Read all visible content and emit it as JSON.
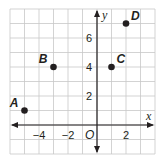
{
  "chart_data": {
    "type": "scatter",
    "title": "",
    "xlabel": "x",
    "ylabel": "y",
    "origin_label": "O",
    "xlim": [
      -6,
      4
    ],
    "ylim": [
      -2,
      8
    ],
    "grid": true,
    "x_ticks": [
      {
        "value": -4,
        "label": "−4"
      },
      {
        "value": -2,
        "label": "−2"
      },
      {
        "value": 2,
        "label": "2"
      }
    ],
    "y_ticks": [
      {
        "value": 2,
        "label": "2"
      },
      {
        "value": 4,
        "label": "4"
      },
      {
        "value": 6,
        "label": "6"
      }
    ],
    "points": [
      {
        "name": "A",
        "x": -5,
        "y": 1
      },
      {
        "name": "B",
        "x": -3,
        "y": 4
      },
      {
        "name": "C",
        "x": 1,
        "y": 4
      },
      {
        "name": "D",
        "x": 2,
        "y": 7
      }
    ]
  },
  "colors": {
    "grid": "#c8c8c8",
    "axis": "#231f20",
    "point": "#231f20"
  }
}
